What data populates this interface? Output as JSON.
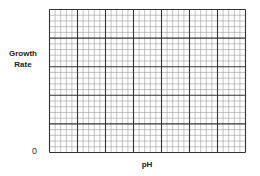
{
  "chart_data": {
    "type": "line",
    "title": "",
    "xlabel": "pH",
    "ylabel": "Growth Rate",
    "ylabel_lines": [
      "Growth",
      "Rate"
    ],
    "origin_label": "0",
    "series": [],
    "grid": true,
    "grid_major_columns": 7,
    "grid_major_rows": 5,
    "grid_minor_per_major": 5,
    "legend": null
  },
  "colors": {
    "grid_major": "#333333",
    "grid_minor": "#9a9a9a",
    "text": "#222222"
  }
}
